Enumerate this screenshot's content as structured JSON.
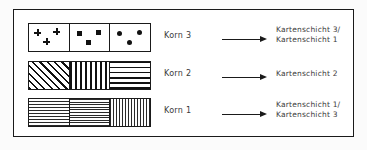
{
  "figure": {
    "frame_color": "#1a1a1a",
    "background_color": "#ffffff",
    "text_color": "#3a3a3a",
    "rows": [
      {
        "korn_label": "Korn 3",
        "arrow": "right-arrow",
        "destination_lines": [
          "Kartenschicht 3/",
          "Kartenschicht 1"
        ],
        "swatch_cells": [
          {
            "pattern": "plus-symbols",
            "symbol_count": 3
          },
          {
            "pattern": "square-symbols",
            "symbol_count": 3
          },
          {
            "pattern": "circle-symbols",
            "symbol_count": 3
          }
        ]
      },
      {
        "korn_label": "Korn 2",
        "arrow": "right-arrow",
        "destination_lines": [
          "Kartenschicht 2"
        ],
        "swatch_cells": [
          {
            "pattern": "diagonal-hatch",
            "symbol_count": 0
          },
          {
            "pattern": "vertical-lines",
            "symbol_count": 0
          },
          {
            "pattern": "horizontal-lines",
            "symbol_count": 0
          }
        ]
      },
      {
        "korn_label": "Korn 1",
        "arrow": "right-arrow",
        "destination_lines": [
          "Kartenschicht 1/",
          "Kartenschicht 3"
        ],
        "swatch_cells": [
          {
            "pattern": "fine-horizontal-dashes",
            "symbol_count": 0
          },
          {
            "pattern": "fine-stipple-dots",
            "symbol_count": 0
          },
          {
            "pattern": "fine-vertical-dashes",
            "symbol_count": 0
          }
        ]
      }
    ]
  }
}
